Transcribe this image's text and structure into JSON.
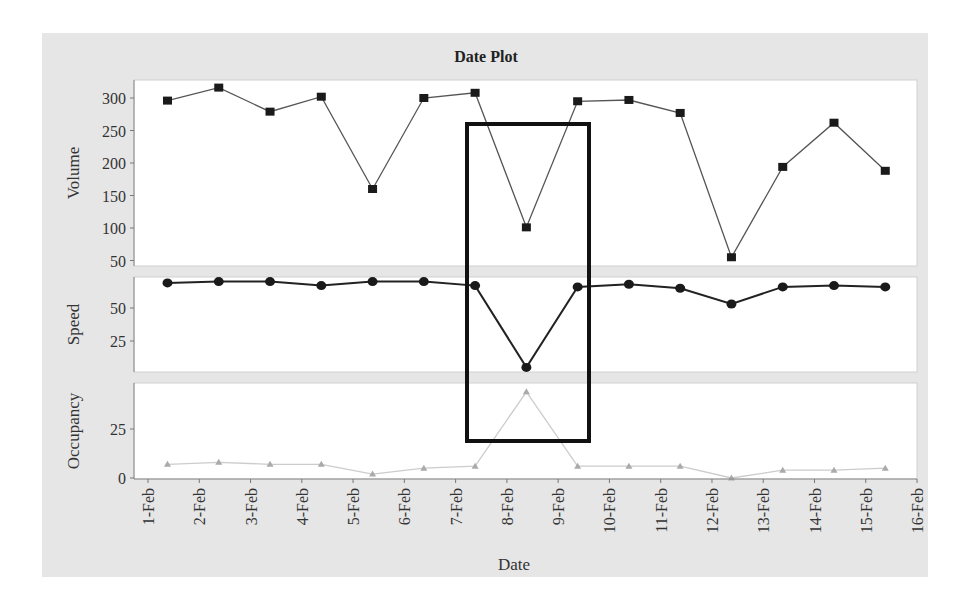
{
  "chart_data": {
    "type": "line",
    "title": "Date Plot",
    "xlabel": "Date",
    "x_tick_labels": [
      "1-Feb",
      "2-Feb",
      "3-Feb",
      "4-Feb",
      "5-Feb",
      "6-Feb",
      "7-Feb",
      "8-Feb",
      "9-Feb",
      "10-Feb",
      "11-Feb",
      "12-Feb",
      "13-Feb",
      "14-Feb",
      "15-Feb",
      "16-Feb"
    ],
    "categories": [
      "1-Feb",
      "2-Feb",
      "3-Feb",
      "4-Feb",
      "5-Feb",
      "6-Feb",
      "7-Feb",
      "8-Feb",
      "9-Feb",
      "10-Feb",
      "11-Feb",
      "12-Feb",
      "13-Feb",
      "14-Feb",
      "15-Feb"
    ],
    "panels": [
      {
        "name": "Volume",
        "ylabel": "Volume",
        "yticks": [
          50,
          100,
          150,
          200,
          250,
          300
        ],
        "ylim": [
          40,
          330
        ],
        "marker": "square",
        "color": "#1a1a1a",
        "values": [
          296,
          316,
          279,
          302,
          160,
          300,
          308,
          101,
          295,
          297,
          277,
          55,
          194,
          262,
          188
        ]
      },
      {
        "name": "Speed",
        "ylabel": "Speed",
        "yticks": [
          25,
          50
        ],
        "ylim": [
          0,
          73
        ],
        "marker": "circle",
        "color": "#1a1a1a",
        "values": [
          69,
          70,
          70,
          67,
          70,
          70,
          67,
          5,
          66,
          68,
          65,
          53,
          66,
          67,
          66
        ]
      },
      {
        "name": "Occupancy",
        "ylabel": "Occupancy",
        "yticks": [
          0,
          25
        ],
        "ylim": [
          0,
          48
        ],
        "marker": "triangle",
        "color": "#aaaaaa",
        "values": [
          7,
          8,
          7,
          7,
          2,
          5,
          6,
          44,
          6,
          6,
          6,
          0,
          4,
          4,
          5
        ]
      }
    ],
    "annotations": [
      {
        "type": "rectangle",
        "description": "Highlight box around 8-Feb anomaly",
        "x_range": [
          "7-Feb",
          "9-Feb"
        ]
      }
    ],
    "grid": false,
    "legend": null
  }
}
